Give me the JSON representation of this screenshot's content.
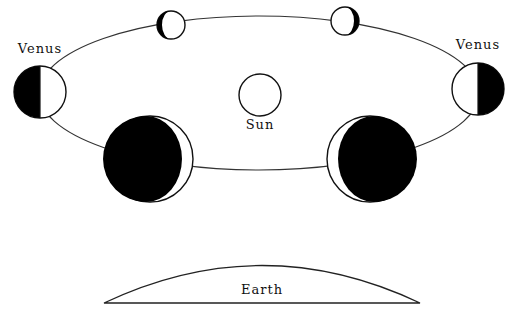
{
  "diagram": {
    "labels": {
      "venus_left": "Venus",
      "venus_right": "Venus",
      "sun": "Sun",
      "earth": "Earth"
    },
    "phases": [
      {
        "position": "top-left",
        "phase": "gibbous (nearly full)"
      },
      {
        "position": "top-right",
        "phase": "gibbous (nearly full)"
      },
      {
        "position": "left",
        "phase": "half"
      },
      {
        "position": "right",
        "phase": "half"
      },
      {
        "position": "bottom-left",
        "phase": "crescent"
      },
      {
        "position": "bottom-right",
        "phase": "crescent"
      }
    ],
    "colors": {
      "line": "#222222",
      "dark": "#000000",
      "lit": "#ffffff"
    }
  }
}
